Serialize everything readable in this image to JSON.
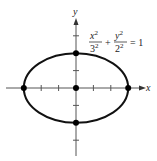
{
  "figure": {
    "type": "ellipse-graph",
    "equation": {
      "term1_num": "x",
      "term1_num_exp": "2",
      "term1_den": "3",
      "term1_den_exp": "2",
      "plus": "+",
      "term2_num": "y",
      "term2_num_exp": "2",
      "term2_den": "2",
      "term2_den_exp": "2",
      "equals": "= 1"
    },
    "axes": {
      "x_label": "x",
      "y_label": "y"
    },
    "ellipse": {
      "h": 0,
      "k": 0,
      "a": 3,
      "b": 2
    },
    "x_ticks": [
      -3,
      -2,
      -1,
      1,
      2,
      3
    ],
    "y_ticks": [
      -3,
      -2,
      -1,
      1,
      2,
      3
    ],
    "points": [
      {
        "name": "center",
        "x": 0,
        "y": 0
      },
      {
        "name": "vertex-left",
        "x": -3,
        "y": 0
      },
      {
        "name": "vertex-right",
        "x": 3,
        "y": 0
      },
      {
        "name": "covertex-top",
        "x": 0,
        "y": 2
      },
      {
        "name": "covertex-bottom",
        "x": 0,
        "y": -2
      }
    ]
  }
}
